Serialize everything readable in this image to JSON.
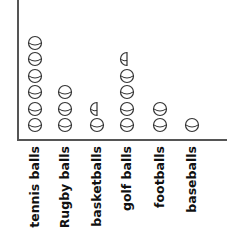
{
  "chart_data": {
    "type": "pictograph",
    "title": "",
    "xlabel": "",
    "ylabel": "",
    "categories": [
      "tennis balls",
      "Rugby balls",
      "basketballs",
      "golf balls",
      "footballs",
      "baseballs"
    ],
    "values": [
      6,
      3,
      1.5,
      4.5,
      2,
      1
    ],
    "symbol": "ball",
    "half_symbols_present": true,
    "grid": false,
    "legend": null
  },
  "style": {
    "axis_color": "#555555",
    "ball_stroke": "#333333",
    "label_color": "#111111"
  }
}
